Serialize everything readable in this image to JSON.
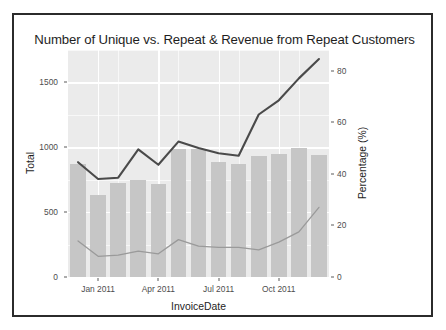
{
  "figure": {
    "title": "Number of Unique vs. Repeat & Revenue from Repeat Customers",
    "background_color": "#ffffff",
    "frame_color": "#2b2b2b",
    "panel_color": "#ebebeb",
    "grid_color": "#ffffff",
    "bar_color": "#c6c6c6",
    "line_dark_color": "#4a4a4a",
    "line_light_color": "#9a9a9a"
  },
  "chart_data": {
    "type": "bar",
    "title": "Number of Unique vs. Repeat & Revenue from Repeat Customers",
    "xlabel": "InvoiceDate",
    "ylabel": "Total",
    "y2label": "Percentage (%)",
    "grid": true,
    "legend": "none",
    "categories": [
      "Dec 2010",
      "Jan 2011",
      "Feb 2011",
      "Mar 2011",
      "Apr 2011",
      "May 2011",
      "Jun 2011",
      "Jul 2011",
      "Aug 2011",
      "Sep 2011",
      "Oct 2011",
      "Nov 2011",
      "Dec 2011"
    ],
    "x_tick_labels": [
      "Jan 2011",
      "Apr 2011",
      "Jul 2011",
      "Oct 2011"
    ],
    "x_tick_categories": [
      "Jan 2011",
      "Apr 2011",
      "Jul 2011",
      "Oct 2011"
    ],
    "ylim": [
      0,
      1750
    ],
    "y_ticks": [
      0,
      500,
      1000,
      1500
    ],
    "y_tick_labels": [
      "0",
      "500",
      "1000",
      "1500"
    ],
    "y2lim": [
      0,
      88
    ],
    "y2_ticks": [
      0,
      20,
      40,
      60,
      80
    ],
    "y2_tick_labels": [
      "0",
      "20",
      "40",
      "60",
      "80"
    ],
    "series": [
      {
        "name": "Total",
        "kind": "bar",
        "axis": "left",
        "values": [
          870,
          630,
          725,
          745,
          720,
          985,
          990,
          885,
          870,
          935,
          945,
          995,
          940
        ]
      },
      {
        "name": "Repeat Customer Percentage",
        "kind": "line",
        "axis": "right",
        "color": "#4a4a4a",
        "values": [
          44.5,
          38.0,
          38.5,
          49.5,
          43.5,
          52.5,
          50.0,
          48.0,
          47.0,
          63.0,
          68.5,
          77.0,
          84.5
        ]
      },
      {
        "name": "Repeat Revenue Percentage",
        "kind": "line",
        "axis": "right",
        "color": "#9a9a9a",
        "values": [
          14.0,
          8.0,
          8.5,
          10.0,
          9.0,
          14.5,
          12.0,
          11.5,
          11.5,
          10.5,
          13.5,
          17.5,
          27.0
        ]
      }
    ]
  }
}
